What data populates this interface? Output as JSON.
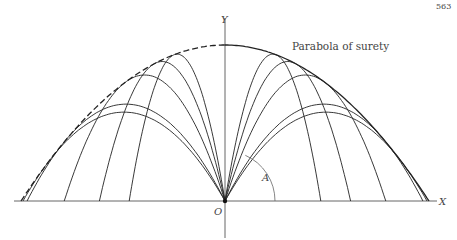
{
  "page_number": "563",
  "figure": {
    "title": "Parabola of surety",
    "axis_x_label": "X",
    "axis_y_label": "Y",
    "origin_label": "O",
    "angle_label": "A",
    "envelope_label": "Parabola of surety",
    "colors": {
      "ink": "#222222",
      "axis": "#555555",
      "label": "#444444",
      "background": "#ffffff"
    },
    "geometry": {
      "origin_px": [
        225,
        201
      ],
      "x_scale_px": 204,
      "y_scale_px": 312,
      "x_axis_px": [
        14,
        437
      ],
      "y_axis_px": [
        18,
        238
      ],
      "envelope_apex_px": [
        225,
        45
      ]
    },
    "trajectories_launch_angles_deg": [
      49,
      52,
      64,
      71,
      76,
      104,
      109,
      116,
      128,
      131
    ]
  }
}
